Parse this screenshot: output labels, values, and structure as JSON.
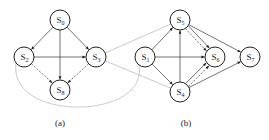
{
  "figure": {
    "subfigures": [
      {
        "id": "a",
        "caption": "(a)",
        "caption_pos": [
          60,
          126
        ],
        "nodes": [
          {
            "id": "S0",
            "label": "S",
            "sub": "0",
            "x": 60,
            "y": 20
          },
          {
            "id": "S2",
            "label": "S",
            "sub": "2",
            "x": 24,
            "y": 57
          },
          {
            "id": "S3",
            "label": "S",
            "sub": "3",
            "x": 96,
            "y": 57
          },
          {
            "id": "S8",
            "label": "S",
            "sub": "8",
            "x": 60,
            "y": 90
          }
        ],
        "edges": [
          {
            "from": "S0",
            "to": "S2",
            "style": "solid"
          },
          {
            "from": "S0",
            "to": "S3",
            "style": "solid"
          },
          {
            "from": "S0",
            "to": "S8",
            "style": "solid"
          },
          {
            "from": "S2",
            "to": "S3",
            "style": "solid"
          },
          {
            "from": "S2",
            "to": "S8",
            "style": "dashed"
          },
          {
            "from": "S3",
            "to": "S8",
            "style": "dashed"
          }
        ]
      },
      {
        "id": "b",
        "caption": "(b)",
        "caption_pos": [
          186,
          126
        ],
        "nodes": [
          {
            "id": "S5",
            "label": "S",
            "sub": "5",
            "x": 180,
            "y": 20
          },
          {
            "id": "S1",
            "label": "S",
            "sub": "1",
            "x": 145,
            "y": 57
          },
          {
            "id": "S6",
            "label": "S",
            "sub": "6",
            "x": 215,
            "y": 57
          },
          {
            "id": "S7",
            "label": "S",
            "sub": "7",
            "x": 250,
            "y": 57
          },
          {
            "id": "S4",
            "label": "S",
            "sub": "4",
            "x": 180,
            "y": 92
          }
        ],
        "edges": [
          {
            "from": "S1",
            "to": "S5",
            "style": "solid"
          },
          {
            "from": "S1",
            "to": "S4",
            "style": "solid"
          },
          {
            "from": "S1",
            "to": "S6",
            "style": "solid"
          },
          {
            "from": "S4",
            "to": "S5",
            "style": "solid"
          },
          {
            "from": "S5",
            "to": "S6",
            "style": "solid"
          },
          {
            "from": "S5",
            "to": "S6",
            "style": "dashed"
          },
          {
            "from": "S4",
            "to": "S6",
            "style": "solid"
          },
          {
            "from": "S4",
            "to": "S6",
            "style": "dashed"
          },
          {
            "from": "S5",
            "to": "S7",
            "style": "solid"
          },
          {
            "from": "S4",
            "to": "S7",
            "style": "solid"
          }
        ]
      }
    ],
    "cross_links": [
      {
        "from": "S3",
        "to": "S5",
        "style": "gray"
      },
      {
        "from": "S3",
        "to": "S4",
        "style": "gray"
      },
      {
        "from": "S2",
        "to": "S1",
        "style": "gray-curve"
      }
    ],
    "node_radius": 10
  }
}
